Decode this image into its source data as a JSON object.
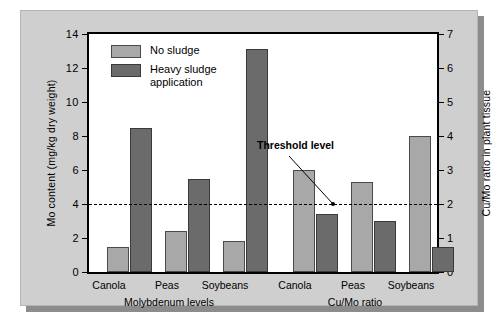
{
  "chart_data": {
    "type": "bar",
    "title": "",
    "subtitle": "",
    "grid": false,
    "legend_position": "top-left-inside",
    "categories": [
      "Canola",
      "Peas",
      "Soybeans",
      "Canola",
      "Peas",
      "Soybeans"
    ],
    "series": [
      {
        "name": "No sludge",
        "color": "#a8a8a8",
        "values": [
          1.5,
          2.4,
          1.8,
          6.0,
          5.3,
          8.0
        ]
      },
      {
        "name": "Heavy sludge application",
        "color": "#6b6b6b",
        "values": [
          8.5,
          5.5,
          13.1,
          3.4,
          3.0,
          1.5
        ]
      }
    ],
    "groups": [
      {
        "label": "Molybdenum levels",
        "axis": "left",
        "categories": [
          "Canola",
          "Peas",
          "Soybeans"
        ],
        "no_sludge": [
          1.5,
          2.4,
          1.8
        ],
        "heavy_sludge": [
          8.5,
          5.5,
          13.1
        ]
      },
      {
        "label": "Cu/Mo ratio",
        "axis": "right",
        "categories": [
          "Canola",
          "Peas",
          "Soybeans"
        ],
        "no_sludge_left_scale": [
          6.0,
          5.3,
          8.0
        ],
        "heavy_sludge_left_scale": [
          3.4,
          3.0,
          1.5
        ],
        "no_sludge_right_scale": [
          3.0,
          2.65,
          4.0
        ],
        "heavy_sludge_right_scale": [
          1.7,
          1.5,
          0.75
        ]
      }
    ],
    "xlabel": "",
    "ylabel": "Mo content (mg/kg dry weight)",
    "y2label": "Cu/Mo ratio in plant tissue",
    "ylim": [
      0,
      14
    ],
    "y2lim": [
      0,
      7
    ],
    "yticks": [
      0,
      2,
      4,
      6,
      8,
      10,
      12,
      14
    ],
    "y2ticks": [
      0,
      1,
      2,
      3,
      4,
      5,
      6,
      7
    ],
    "ytick_labels": [
      "0",
      "2",
      "4",
      "6",
      "8",
      "10",
      "12",
      "14"
    ],
    "y2tick_labels": [
      "0",
      "1",
      "2",
      "3",
      "4",
      "5",
      "6",
      "7"
    ],
    "annotations": [
      {
        "text": "Threshold level",
        "value_right_axis": 2,
        "value_left_axis": 4,
        "style": "dashed-line-with-leader"
      }
    ]
  },
  "legend": {
    "entries": [
      {
        "label": "No sludge",
        "swatch": "light-gray-swatch"
      },
      {
        "label": "Heavy sludge\napplication",
        "swatch": "dark-gray-swatch"
      }
    ]
  },
  "axes": {
    "left_title": "Mo content (mg/kg dry weight)",
    "right_title": "Cu/Mo ratio in plant tissue"
  },
  "group_labels": {
    "left": "Molybdenum levels",
    "right": "Cu/Mo ratio"
  },
  "annotation": {
    "threshold_label": "Threshold level"
  },
  "colors": {
    "panel_background": "#cfcfcf",
    "plot_background": "#ffffff",
    "no_sludge_bar": "#a8a8a8",
    "heavy_sludge_bar": "#6b6b6b",
    "axis": "#000000",
    "shadow": "#8c8c8c"
  }
}
